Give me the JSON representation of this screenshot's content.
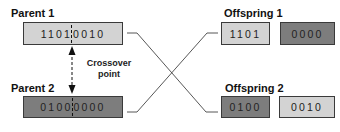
{
  "parent1": {
    "title": "Parent 1",
    "left_bits": "1101",
    "right_bits": "0010",
    "color": "#d3d3d3"
  },
  "parent2": {
    "title": "Parent 2",
    "left_bits": "0100",
    "right_bits": "0000",
    "color": "#7d7d7d"
  },
  "crossover": {
    "label_line1": "Crossover",
    "label_line2": "point"
  },
  "offspring1": {
    "title": "Offspring 1",
    "segments": [
      {
        "bits": "1101",
        "color": "#d3d3d3"
      },
      {
        "bits": "0000",
        "color": "#7d7d7d"
      }
    ]
  },
  "offspring2": {
    "title": "Offspring 2",
    "segments": [
      {
        "bits": "0100",
        "color": "#7d7d7d"
      },
      {
        "bits": "0010",
        "color": "#d3d3d3"
      }
    ]
  }
}
